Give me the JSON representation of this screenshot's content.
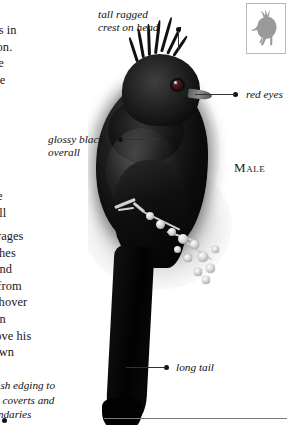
{
  "page": {
    "background_color": "#ffffff",
    "species_subject": "crested black bird"
  },
  "text_columns": {
    "top_paragraph": "at nests in\ng season.\ny in the\nson, the\nbitat\nurvive\nerries.\nving\nslate-\ne.\nwhistle\nlow call",
    "bottom_paragraph": "ps. Forages\nl. Catches\nletoe and\nhrubs from\n. May hover\nsplay in\nles above his\ntheir own"
  },
  "bottom_caption": {
    "text": "whitish edging to\nwing coverts and\nsecondaries"
  },
  "callouts": [
    {
      "id": "crest",
      "label": "tall ragged\ncrest on head",
      "icon": "leader-dot"
    },
    {
      "id": "red-eyes",
      "label": "red eyes",
      "icon": "leader-dot"
    },
    {
      "id": "glossy",
      "label": "glossy black\noverall",
      "icon": "leader-dot"
    },
    {
      "id": "long-tail",
      "label": "long tail",
      "icon": "leader-dot"
    }
  ],
  "sex_label": {
    "first_letter": "M",
    "rest": "ALE",
    "full": "MALE"
  },
  "thumbnail": {
    "icon_name": "bird-silhouette-icon",
    "fill_color": "#9a9a9a",
    "border_color": "#b9b9b9"
  },
  "colors": {
    "text": "#171717",
    "leader_line": "#333333",
    "rule": "#7a7a7a",
    "bird_black": "#0b0b0b",
    "eye_red": "#3a1216"
  }
}
